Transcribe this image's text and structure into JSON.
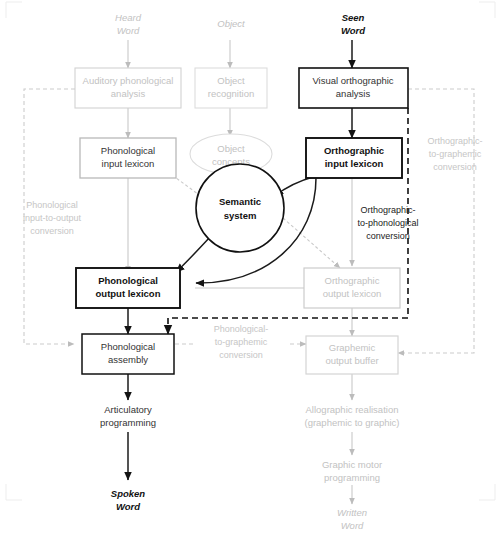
{
  "figure": {
    "caption": "",
    "colors": {
      "ink": "#111111",
      "mid": "#333333",
      "faint": "#c2c2c2",
      "paper": "#ffffff"
    }
  },
  "inputs": [
    {
      "id": "heard-word",
      "line1": "Heard",
      "line2": "Word",
      "emphasis": "faint"
    },
    {
      "id": "object",
      "line1": "Object",
      "line2": "",
      "emphasis": "faint"
    },
    {
      "id": "seen-word",
      "line1": "Seen",
      "line2": "Word",
      "emphasis": "bold"
    }
  ],
  "outputs": [
    {
      "id": "spoken-word",
      "line1": "Spoken",
      "line2": "Word",
      "emphasis": "bold"
    },
    {
      "id": "written-word",
      "line1": "Written",
      "line2": "Word",
      "emphasis": "faint"
    }
  ],
  "boxes": [
    {
      "id": "auditory-phonological-analysis",
      "line1": "Auditory phonological",
      "line2": "analysis",
      "emphasis": "faint"
    },
    {
      "id": "object-recognition",
      "line1": "Object",
      "line2": "recognition",
      "emphasis": "faint"
    },
    {
      "id": "visual-orthographic-analysis",
      "line1": "Visual orthographic",
      "line2": "analysis",
      "emphasis": "normal"
    },
    {
      "id": "phonological-input-lexicon",
      "line1": "Phonological",
      "line2": "input lexicon",
      "emphasis": "normal"
    },
    {
      "id": "orthographic-input-lexicon",
      "line1": "Orthographic",
      "line2": "input lexicon",
      "emphasis": "bold"
    },
    {
      "id": "phonological-output-lexicon",
      "line1": "Phonological",
      "line2": "output lexicon",
      "emphasis": "bold"
    },
    {
      "id": "orthographic-output-lexicon",
      "line1": "Orthographic",
      "line2": "output lexicon",
      "emphasis": "faint"
    },
    {
      "id": "phonological-assembly",
      "line1": "Phonological",
      "line2": "assembly",
      "emphasis": "normal"
    },
    {
      "id": "graphemic-output-buffer",
      "line1": "Graphemic",
      "line2": "output buffer",
      "emphasis": "faint"
    }
  ],
  "ellipses": [
    {
      "id": "object-concepts",
      "line1": "Object",
      "line2": "concepts",
      "emphasis": "faint"
    },
    {
      "id": "semantic-system",
      "line1": "Semantic",
      "line2": "system",
      "emphasis": "bold"
    }
  ],
  "plain_stages": [
    {
      "id": "articulatory-programming",
      "line1": "Articulatory",
      "line2": "programming",
      "emphasis": "normal"
    },
    {
      "id": "allographic-realisation",
      "line1": "Allographic realisation",
      "line2": "(graphemic to graphic)",
      "emphasis": "faint"
    },
    {
      "id": "graphic-motor-programming",
      "line1": "Graphic motor",
      "line2": "programming",
      "emphasis": "faint"
    }
  ],
  "route_labels": [
    {
      "id": "phonological-input-to-output-conversion",
      "line1": "Phonological",
      "line2": "input-to-output",
      "line3": "conversion",
      "emphasis": "faint"
    },
    {
      "id": "orthographic-to-phonological-conversion",
      "line1": "Orthographic-",
      "line2": "to-phonological",
      "line3": "conversion",
      "emphasis": "dark"
    },
    {
      "id": "orthographic-to-graphemic-conversion",
      "line1": "Orthographic-",
      "line2": "to-graphemic",
      "line3": "conversion",
      "emphasis": "faint"
    },
    {
      "id": "phonological-to-graphemic-conversion",
      "line1": "Phonological-",
      "line2": "to-graphemic",
      "line3": "conversion",
      "emphasis": "faint"
    }
  ]
}
